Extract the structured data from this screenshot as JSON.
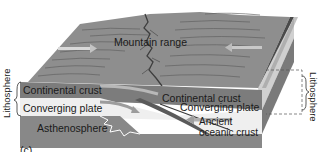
{
  "figure": {
    "panel_label": "(c)",
    "labels": {
      "mountain_range": "Mountain range",
      "continental_crust_left": "Continental crust",
      "continental_crust_right": "Continental crust",
      "converging_plate_left": "Converging plate",
      "converging_plate_right": "Converging plate",
      "asthenosphere": "Asthenosphere",
      "ancient_oceanic_crust_line1": "Ancient",
      "ancient_oceanic_crust_line2": "oceanic crust",
      "lithosphere_left": "Lithosphere",
      "lithosphere_right": "Lithosphere"
    },
    "colors": {
      "surface": "#8e8e8e",
      "surface_lines": "#5c5c5c",
      "continental_crust": "#7c7c7c",
      "converging_plate": "#efefef",
      "asthenosphere": "#8a8a8a",
      "side_dark": "#4a4a4a",
      "side_light": "#cfcfcf",
      "arrow": "#a8a8a8"
    }
  }
}
